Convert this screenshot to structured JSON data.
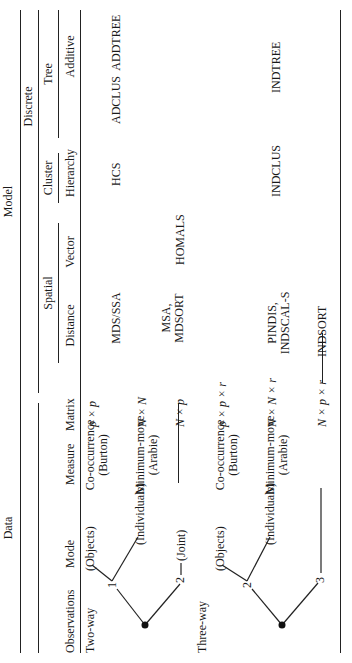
{
  "header": {
    "data": "Data",
    "model": "Model",
    "observations": "Observations",
    "mode": "Mode",
    "measure": "Measure",
    "matrix": "Matrix",
    "spatial": "Spatial",
    "discrete": "Discrete",
    "cluster": "Cluster",
    "tree": "Tree",
    "distance": "Distance",
    "vector": "Vector",
    "hierarchy": "Hierarchy",
    "additive": "Additive"
  },
  "rows": [
    {
      "observations": "Two-way",
      "branch": "1",
      "mode": "(Objects)",
      "measure": "Co-occurrence",
      "measure_sub": "(Burton)",
      "matrix": "p × p",
      "distance": "MDS/SSA",
      "vector": "",
      "hierarchy": "HCS",
      "additive": "ADCLUS  ADDTREE"
    },
    {
      "mode": "(Individuals)",
      "measure": "Minimum-move",
      "measure_sub": "(Arabie)",
      "matrix": "N × N"
    },
    {
      "branch": "2",
      "mode": "(Joint)",
      "matrix": "N × p",
      "distance": "MSA,",
      "distance_2": "MDSORT",
      "vector": "HOMALS"
    },
    {
      "observations": "Three-way",
      "branch": "2",
      "mode": "(Objects)",
      "measure": "Co-occurrence",
      "measure_sub": "(Burton)",
      "matrix": "p × p × r"
    },
    {
      "mode": "(Individuals)",
      "measure": "Minimum-move",
      "measure_sub": "(Arabie)",
      "matrix": "N × N × r",
      "distance": "PINDIS,",
      "distance_2": "INDSCAL-S",
      "hierarchy": "INDCLUS",
      "additive": "INDTREE"
    },
    {
      "branch": "3",
      "matrix": "N × p × r",
      "distance": "INDSORT"
    }
  ]
}
